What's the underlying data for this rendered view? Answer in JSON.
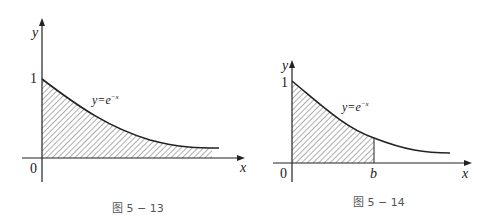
{
  "figures": [
    {
      "id": "fig-5-13",
      "caption": "图 5 − 13",
      "y_axis_label": "y",
      "x_axis_label": "x",
      "origin_label": "0",
      "y_tick_label": "1",
      "curve_label_lhs": "y=e",
      "curve_label_exp": "−x",
      "shaded_region": "area under y=e^-x from 0 to infinity"
    },
    {
      "id": "fig-5-14",
      "caption": "图 5 − 14",
      "y_axis_label": "y",
      "x_axis_label": "x",
      "origin_label": "0",
      "y_tick_label": "1",
      "b_label": "b",
      "curve_label_lhs": "y=e",
      "curve_label_exp": "−x",
      "shaded_region": "area under y=e^-x from 0 to b"
    }
  ],
  "colors": {
    "line": "#222222",
    "caption": "#555555"
  }
}
